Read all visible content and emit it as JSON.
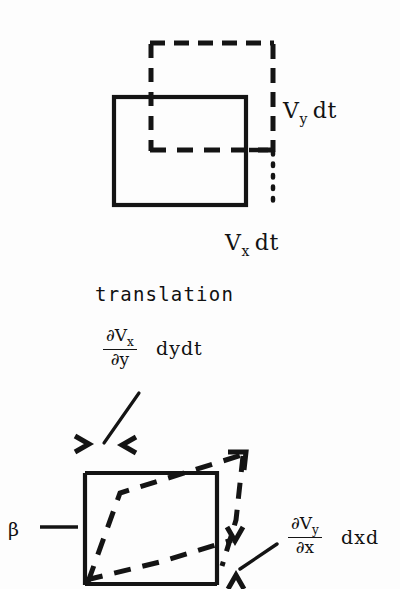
{
  "figure": {
    "background_color": "#fdfdfd",
    "ink_color": "#141414",
    "caption": "translation"
  },
  "top_diagram": {
    "name": "translation-diagram",
    "solid_square": {
      "x": 114,
      "y": 97,
      "width": 132,
      "height": 108
    },
    "dashed_square": {
      "x": 150,
      "y": 43,
      "width": 124,
      "height": 108
    },
    "labels": {
      "vy_symbol": "V",
      "vy_subscript": "y",
      "vy_tail": "dt",
      "vx_symbol": "V",
      "vx_subscript": "x",
      "vx_tail": "dt"
    }
  },
  "bottom_diagram": {
    "name": "deformation-diagram",
    "solid_square": {
      "x": 85,
      "y": 473,
      "width": 132,
      "height": 112
    },
    "labels": {
      "top_fraction_numerator_symbol": "∂V",
      "top_fraction_numerator_subscript": "x",
      "top_fraction_denominator": "∂y",
      "top_fraction_tail": "dydt",
      "right_fraction_numerator_symbol": "∂V",
      "right_fraction_numerator_subscript": "y",
      "right_fraction_denominator": "∂x",
      "right_fraction_tail": "dxd",
      "beta": "β",
      "angle_mark_top_left": ">",
      "angle_mark_top_right": "<",
      "angle_mark_right_upper": "v",
      "angle_mark_right_lower": "^"
    }
  }
}
